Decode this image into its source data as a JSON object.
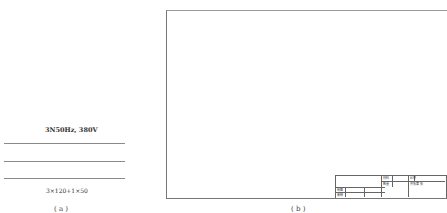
{
  "left_panel": {
    "supply_label": "3N50Hz, 380V",
    "cable_label": "3×120+1×50",
    "caption": "( a )"
  },
  "right_panel": {
    "caption": "( b )",
    "title_block": {
      "material": "材料",
      "scale": "比例",
      "quantity": "数量",
      "sheets": "共 张第 张",
      "drawn_by": "制图",
      "reviewed_by": "审核"
    }
  }
}
